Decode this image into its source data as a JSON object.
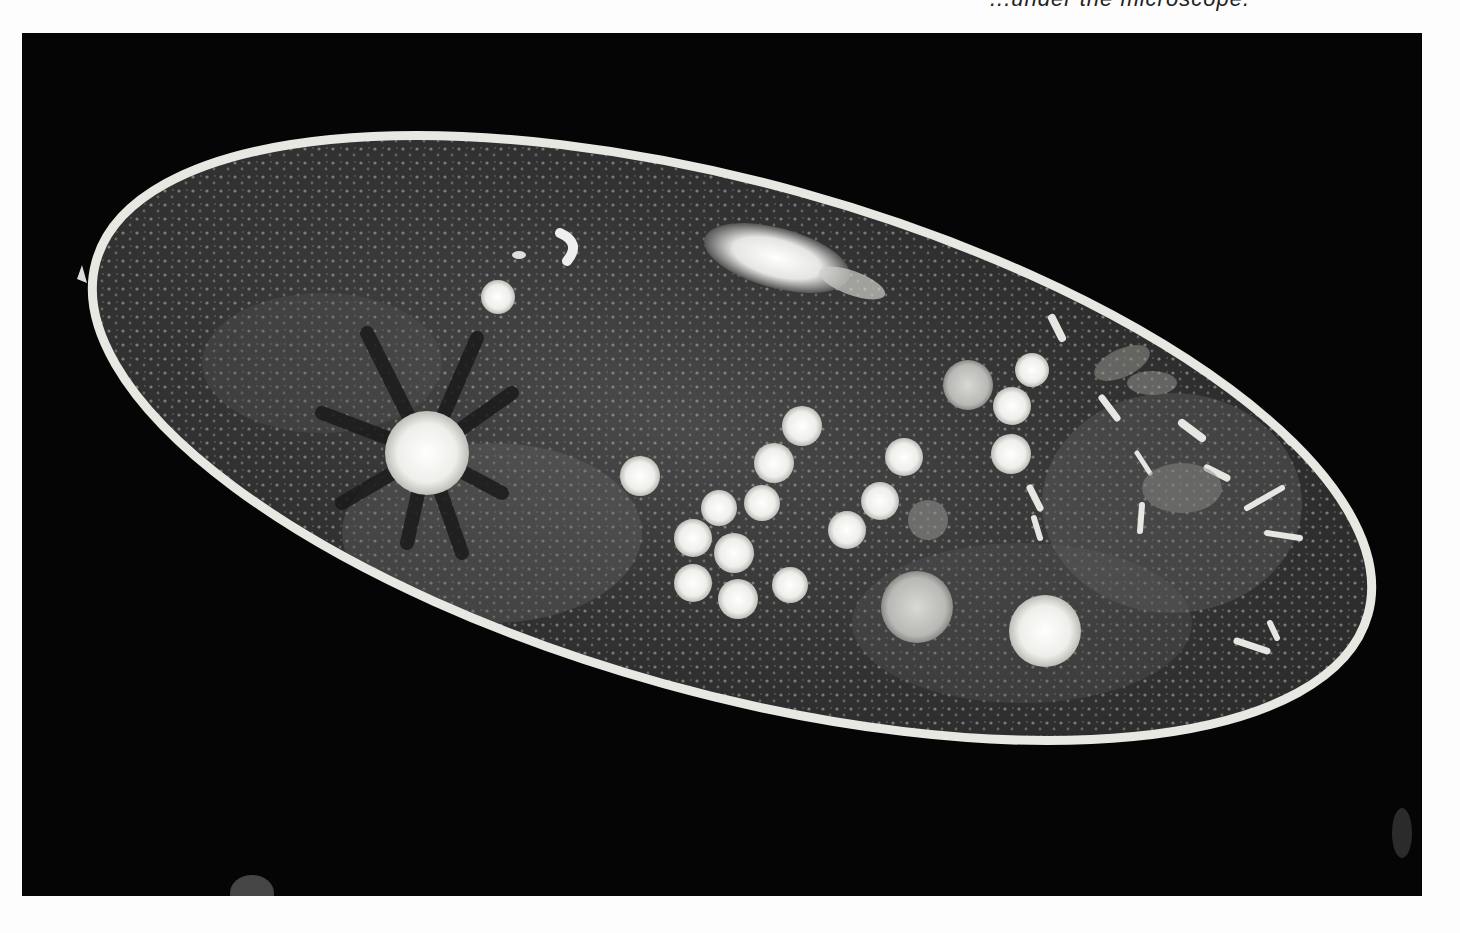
{
  "page": {
    "caption_fragment": "...under the microscope.",
    "background_color": "#fdfdfd"
  },
  "photo": {
    "subject": "Paramecium cell (light micrograph, dark-field)",
    "background_color": "#050505",
    "membrane_color": "#e8e8e2",
    "cytoplasm_color": "#3a3a3a",
    "vacuole_color": "#f2f2ee",
    "features": [
      {
        "name": "contractile-vacuole-anterior",
        "label": "Contractile vacuole with radiating canals"
      },
      {
        "name": "contractile-vacuole-posterior",
        "label": "Contractile vacuole"
      },
      {
        "name": "macronucleus",
        "label": "Macronucleus"
      },
      {
        "name": "food-vacuoles",
        "label": "Food vacuoles"
      },
      {
        "name": "trichocysts",
        "label": "Trichocyst clusters"
      }
    ]
  }
}
